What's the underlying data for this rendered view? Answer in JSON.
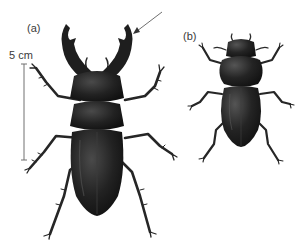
{
  "figure": {
    "panel_a": {
      "label": "(a)",
      "subject": "male stag beetle, dorsal view"
    },
    "panel_b": {
      "label": "(b)",
      "subject": "female stag beetle, dorsal view"
    },
    "scale_bar": {
      "label": "5 cm"
    },
    "annotation": {
      "type": "arrow",
      "target": "tip of right mandible of beetle (a)"
    },
    "colors": {
      "background": "#ffffff",
      "beetle_body": "#1e1e1e",
      "beetle_highlight": "#5a5a5a",
      "text": "#3a3a3a",
      "lines": "#707070"
    }
  }
}
